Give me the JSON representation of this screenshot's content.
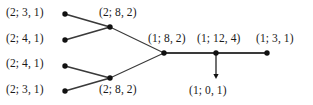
{
  "diagram": {
    "type": "node-edge-graph",
    "background_color": "#ffffff",
    "node_color": "#111111",
    "edge_color": "#3a3a3a",
    "text_color": "#1a1a1a",
    "nodes": [
      {
        "id": "n1",
        "label": "(2; 3, 1)",
        "x": 65,
        "y": 14
      },
      {
        "id": "n2",
        "label": "(2; 4, 1)",
        "x": 65,
        "y": 40
      },
      {
        "id": "n3",
        "label": "(2; 4, 1)",
        "x": 65,
        "y": 66
      },
      {
        "id": "n4",
        "label": "(2; 3, 1)",
        "x": 65,
        "y": 91
      },
      {
        "id": "n5",
        "label": "(2; 8, 2)",
        "x": 110,
        "y": 27
      },
      {
        "id": "n6",
        "label": "(2; 8, 2)",
        "x": 110,
        "y": 78
      },
      {
        "id": "n7",
        "label": "(1; 8, 2)",
        "x": 164,
        "y": 53
      },
      {
        "id": "n8",
        "label": "(1; 12, 4)",
        "x": 216,
        "y": 53
      },
      {
        "id": "n9",
        "label": "(1; 3, 1)",
        "x": 267,
        "y": 53
      }
    ],
    "edges": [
      {
        "from": "n1",
        "to": "n5",
        "width": 1.8
      },
      {
        "from": "n2",
        "to": "n5",
        "width": 1.8
      },
      {
        "from": "n3",
        "to": "n6",
        "width": 1.8
      },
      {
        "from": "n4",
        "to": "n6",
        "width": 1.8
      },
      {
        "from": "n5",
        "to": "n7",
        "width": 1.1
      },
      {
        "from": "n6",
        "to": "n7",
        "width": 1.1
      },
      {
        "from": "n7",
        "to": "n8",
        "width": 1.8
      },
      {
        "from": "n8",
        "to": "n9",
        "width": 1.8
      }
    ],
    "arrow": {
      "label": "(1; 0, 1)",
      "from_node": "n8",
      "x": 216,
      "y_start": 53,
      "y_end": 79,
      "direction": "down"
    },
    "labels": [
      {
        "text": "(2; 3, 1)",
        "x": 6,
        "y": 7,
        "name": "label-node-1"
      },
      {
        "text": "(2; 4, 1)",
        "x": 6,
        "y": 33,
        "name": "label-node-2"
      },
      {
        "text": "(2; 4, 1)",
        "x": 6,
        "y": 58,
        "name": "label-node-3"
      },
      {
        "text": "(2; 3, 1)",
        "x": 6,
        "y": 84,
        "name": "label-node-4"
      },
      {
        "text": "(2; 8, 2)",
        "x": 99,
        "y": 7,
        "name": "label-node-5"
      },
      {
        "text": "(2; 8, 2)",
        "x": 99,
        "y": 84,
        "name": "label-node-6"
      },
      {
        "text": "(1; 8, 2)",
        "x": 148,
        "y": 33,
        "name": "label-node-7"
      },
      {
        "text": "(1; 12, 4)",
        "x": 197,
        "y": 33,
        "name": "label-node-8"
      },
      {
        "text": "(1; 3, 1)",
        "x": 256,
        "y": 33,
        "name": "label-node-9"
      },
      {
        "text": "(1; 0, 1)",
        "x": 189,
        "y": 85,
        "name": "label-arrow-sink"
      }
    ]
  }
}
